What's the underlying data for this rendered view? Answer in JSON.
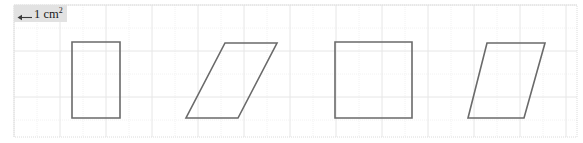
{
  "figure": {
    "width": 583,
    "height": 143,
    "background_color": "#ffffff",
    "legend": {
      "arrow_icon": "left-arrow-icon",
      "unit_label": "1 cm",
      "unit_exponent": "2",
      "chip_background_color": "#e2e2e2"
    },
    "grid": {
      "major_color": "#e8e8e8",
      "minor_color": "#f0f0f0",
      "major_spacing": 46,
      "minor_spacing": 23,
      "origin_x": 14,
      "origin_y": 5,
      "style": "dotted"
    },
    "shape_style": {
      "stroke_color": "#6a6a6a",
      "stroke_width": 1.6,
      "fill": "none"
    },
    "shapes": [
      {
        "name": "rectangle-1",
        "type": "rectangle",
        "points": "72,42 120,42 120,118 72,118"
      },
      {
        "name": "parallelogram-2",
        "type": "parallelogram",
        "points": "225,43 277,43 238,118 186,118"
      },
      {
        "name": "square-3",
        "type": "square",
        "points": "335,42 412,42 412,118 335,118"
      },
      {
        "name": "parallelogram-4",
        "type": "parallelogram",
        "points": "487,43 545,43 524,118 468,118"
      }
    ]
  }
}
